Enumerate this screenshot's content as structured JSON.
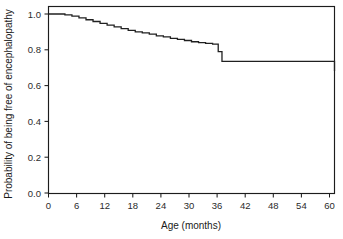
{
  "figure": {
    "background": "#ffffff",
    "line_color": "#202020",
    "axis_color": "#1c1c1c",
    "text_color": "#1a1a1a"
  },
  "chart_data": {
    "type": "line",
    "subtype": "kaplan-meier-step",
    "title": "",
    "xlabel": "Age (months)",
    "ylabel": "Probability of being free of encephalopathy",
    "xlim": [
      0,
      61
    ],
    "ylim": [
      0.0,
      1.05
    ],
    "grid": false,
    "legend": null,
    "xticks": [
      0,
      6,
      12,
      18,
      24,
      30,
      36,
      42,
      48,
      54,
      60
    ],
    "xtick_labels": [
      "0",
      "6",
      "12",
      "18",
      "24",
      "30",
      "36",
      "42",
      "48",
      "54",
      "60"
    ],
    "yticks": [
      0.0,
      0.2,
      0.4,
      0.6,
      0.8,
      1.0
    ],
    "ytick_labels": [
      "0.0",
      "0.2",
      "0.4",
      "0.6",
      "0.8",
      "1.0"
    ],
    "series": [
      {
        "name": "Freedom from encephalopathy",
        "x": [
          0,
          2.0,
          3.5,
          5.0,
          6.5,
          8.0,
          9.5,
          11.0,
          12.5,
          14.0,
          15.5,
          17.0,
          18.5,
          20.0,
          21.5,
          23.0,
          24.5,
          26.0,
          27.5,
          29.0,
          30.5,
          32.0,
          33.5,
          35.0,
          36.2,
          37.0,
          48.0,
          61.0
        ],
        "y": [
          1.0,
          1.0,
          0.995,
          0.988,
          0.978,
          0.968,
          0.958,
          0.948,
          0.938,
          0.928,
          0.918,
          0.908,
          0.9,
          0.895,
          0.888,
          0.878,
          0.872,
          0.864,
          0.858,
          0.852,
          0.845,
          0.84,
          0.836,
          0.832,
          0.79,
          0.735,
          0.735,
          0.682
        ]
      }
    ],
    "annotations": []
  }
}
